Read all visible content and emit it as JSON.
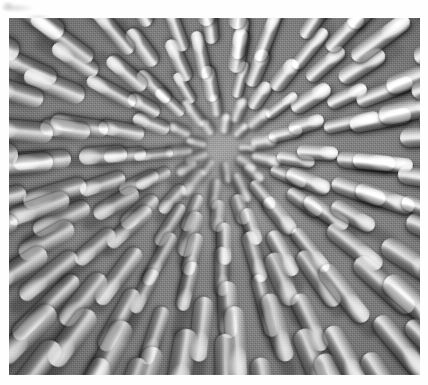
{
  "page": {
    "background_color": "#fefefe",
    "width": 428,
    "height": 385
  },
  "artifact": {
    "name": "scan-smudge-top-left",
    "description": "faint grey scanning smudge in the upper-left page margin",
    "color": "#8a8a8a"
  },
  "photo": {
    "caption": "",
    "media_type": "grayscale macro photograph",
    "subject": "radial spiral array of club-shaped florets",
    "plate_x": 9,
    "plate_y": 18,
    "plate_width": 411,
    "plate_height": 357,
    "center_x": 222,
    "center_y": 148,
    "tones": {
      "highlight": "#f2f2f2",
      "midtone": "#9a9a9a",
      "shadow": "#3a3a3a",
      "plate_base": "#8c8c8c",
      "page_white": "#fefefe"
    },
    "lighting": "upper-right brighter, lower-left deeper shadow",
    "grain": "visible halftone print grain"
  },
  "structure": {
    "type": "phyllotactic-spiral",
    "center": [
      222,
      148
    ],
    "ring_count": 9,
    "rings": [
      {
        "radius": 18,
        "count": 9,
        "length": 20,
        "width": 10,
        "offset": 0,
        "bright": 0.62
      },
      {
        "radius": 34,
        "count": 13,
        "length": 27,
        "width": 12,
        "offset": 14,
        "bright": 0.7
      },
      {
        "radius": 55,
        "count": 17,
        "length": 34,
        "width": 13,
        "offset": 8,
        "bright": 0.78
      },
      {
        "radius": 80,
        "count": 21,
        "length": 42,
        "width": 15,
        "offset": 20,
        "bright": 0.84
      },
      {
        "radius": 110,
        "count": 25,
        "length": 50,
        "width": 16,
        "offset": 5,
        "bright": 0.88
      },
      {
        "radius": 145,
        "count": 29,
        "length": 58,
        "width": 18,
        "offset": 16,
        "bright": 0.9
      },
      {
        "radius": 185,
        "count": 33,
        "length": 66,
        "width": 19,
        "offset": 9,
        "bright": 0.92
      },
      {
        "radius": 230,
        "count": 37,
        "length": 74,
        "width": 21,
        "offset": 21,
        "bright": 0.94
      },
      {
        "radius": 280,
        "count": 41,
        "length": 84,
        "width": 22,
        "offset": 3,
        "bright": 0.96
      }
    ]
  }
}
